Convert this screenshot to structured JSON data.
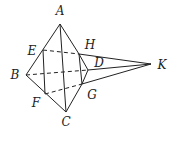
{
  "diagram": {
    "type": "geometry",
    "points": {
      "A": {
        "label": "A",
        "x": 60,
        "y": 24,
        "lx": 60,
        "ly": 15
      },
      "B": {
        "label": "B",
        "x": 26,
        "y": 75,
        "lx": 15,
        "ly": 79
      },
      "C": {
        "label": "C",
        "x": 66,
        "y": 112,
        "lx": 66,
        "ly": 125
      },
      "D": {
        "label": "D",
        "x": 88,
        "y": 70,
        "lx": 99,
        "ly": 66
      },
      "E": {
        "label": "E",
        "x": 43,
        "y": 50,
        "lx": 32,
        "ly": 54
      },
      "F": {
        "label": "F",
        "x": 45,
        "y": 94,
        "lx": 36,
        "ly": 106
      },
      "G": {
        "label": "G",
        "x": 82,
        "y": 84,
        "lx": 92,
        "ly": 98
      },
      "H": {
        "label": "H",
        "x": 79,
        "y": 54,
        "lx": 90,
        "ly": 48
      },
      "K": {
        "label": "K",
        "x": 151,
        "y": 64,
        "lx": 162,
        "ly": 69
      }
    }
  }
}
